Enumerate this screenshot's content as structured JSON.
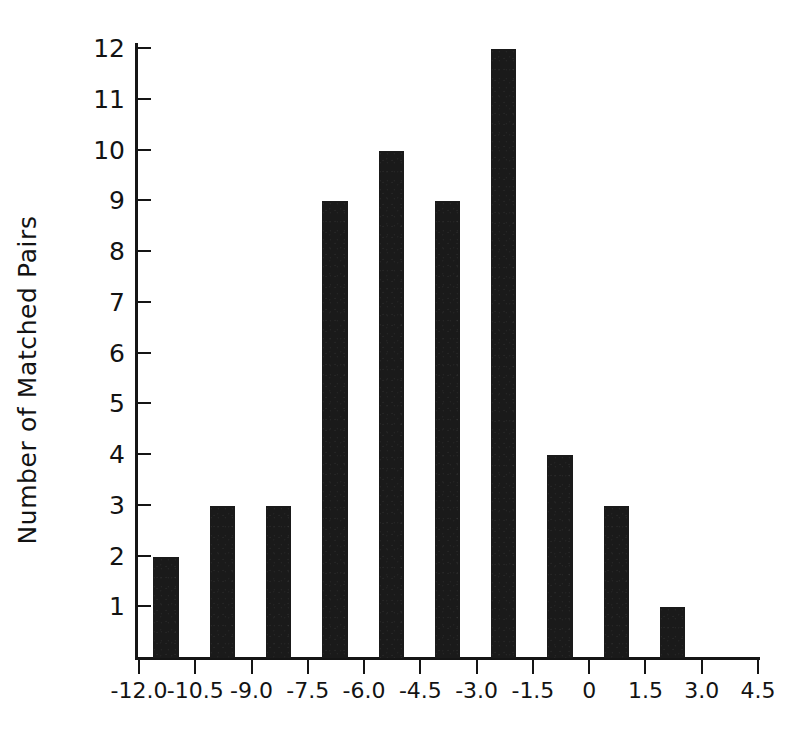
{
  "chart_data": {
    "type": "bar",
    "title": "",
    "subtitle": "",
    "xlabel": "",
    "ylabel": "Number of Matched Pairs",
    "categories": [
      "-12.0 to -10.5",
      "-10.5 to -9.0",
      "-9.0 to -7.5",
      "-7.5 to -6.0",
      "-6.0 to -4.5",
      "-4.5 to -3.0",
      "-3.0 to -1.5",
      "-1.5 to 0",
      "0 to 1.5",
      "1.5 to 3.0"
    ],
    "bin_centers": [
      -11.25,
      -9.75,
      -8.25,
      -6.75,
      -5.25,
      -3.75,
      -2.25,
      -0.75,
      0.75,
      2.25
    ],
    "values": [
      2,
      3,
      3,
      9,
      10,
      9,
      12,
      4,
      3,
      1
    ],
    "bin_width": 1.5,
    "xlim": [
      -12.0,
      4.5
    ],
    "ylim": [
      0,
      12
    ],
    "xticks": [
      "-12.0",
      "-10.5",
      "-9.0",
      "-7.5",
      "-6.0",
      "-4.5",
      "-3.0",
      "-1.5",
      "0",
      "1.5",
      "3.0",
      "4.5"
    ],
    "xtick_values": [
      -12.0,
      -10.5,
      -9.0,
      -7.5,
      -6.0,
      -4.5,
      -3.0,
      -1.5,
      0,
      1.5,
      3.0,
      4.5
    ],
    "yticks": [
      "1",
      "2",
      "3",
      "4",
      "5",
      "6",
      "7",
      "8",
      "9",
      "10",
      "11",
      "12"
    ],
    "ytick_values": [
      1,
      2,
      3,
      4,
      5,
      6,
      7,
      8,
      9,
      10,
      11,
      12
    ],
    "grid": false,
    "legend": "none",
    "bar_color": "#1a1a1a",
    "axis_color": "#151515",
    "background_color": "#ffffff"
  }
}
